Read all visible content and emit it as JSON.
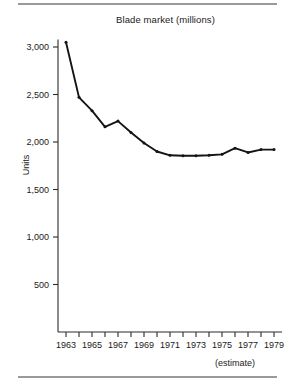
{
  "figure": {
    "title": "Blade market (millions)",
    "y_axis_label": "Units",
    "estimate_note": "(estimate)",
    "line_color": "#141414",
    "axis_color": "#2b2b2b",
    "rule_color": "#9a9a9a",
    "background": "#ffffff"
  },
  "chart_data": {
    "type": "line",
    "title": "Blade market (millions)",
    "xlabel": "",
    "ylabel": "Units",
    "annotations": [
      "(estimate)"
    ],
    "grid": false,
    "legend_position": "none",
    "xlim": [
      1963,
      1979
    ],
    "ylim": [
      0,
      3100
    ],
    "yticks": [
      500,
      1000,
      1500,
      2000,
      2500,
      3000
    ],
    "ytick_labels": [
      "500",
      "1,000",
      "1,500",
      "2,000",
      "2,500",
      "3,000"
    ],
    "xticks": [
      1963,
      1964,
      1965,
      1966,
      1967,
      1968,
      1969,
      1970,
      1971,
      1972,
      1973,
      1974,
      1975,
      1976,
      1977,
      1978,
      1979
    ],
    "xtick_labels": [
      "1963",
      "",
      "1965",
      "",
      "1967",
      "",
      "1969",
      "",
      "1971",
      "",
      "1973",
      "",
      "1975",
      "",
      "1977",
      "",
      "1979"
    ],
    "x": [
      1963,
      1964,
      1965,
      1966,
      1967,
      1968,
      1969,
      1970,
      1971,
      1972,
      1973,
      1974,
      1975,
      1976,
      1977,
      1978,
      1979
    ],
    "values": [
      3050,
      2470,
      2330,
      2160,
      2220,
      2100,
      1990,
      1900,
      1860,
      1855,
      1855,
      1860,
      1870,
      1935,
      1890,
      1920,
      1920
    ]
  }
}
